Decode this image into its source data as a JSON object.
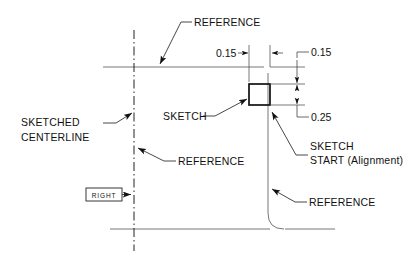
{
  "drawing": {
    "title": "Sketch alignment reference diagram",
    "background_color": "#ffffff",
    "line_color": "#111111",
    "reference_line_color": "#666666",
    "width": 412,
    "height": 259
  },
  "dimensions": [
    {
      "id": "horizontal-offset",
      "value": "0.15",
      "orientation": "horizontal",
      "position": "top-left-of-sketch"
    },
    {
      "id": "vertical-top-offset",
      "value": "0.15",
      "orientation": "vertical",
      "position": "right-upper"
    },
    {
      "id": "vertical-sketch-height",
      "value": "0.25",
      "orientation": "vertical",
      "position": "right-lower"
    }
  ],
  "annotations": [
    {
      "id": "reference-top",
      "label": "REFERENCE",
      "target": "top-horizontal-reference-line"
    },
    {
      "id": "sketched-centerline",
      "label_line_1": "SKETCHED",
      "label_line_2": "CENTERLINE",
      "target": "vertical-dash-dot-centerline"
    },
    {
      "id": "sketch",
      "label": "SKETCH",
      "target": "sketch-rectangle"
    },
    {
      "id": "reference-middle",
      "label": "REFERENCE",
      "target": "vertical-dash-dot-centerline"
    },
    {
      "id": "sketch-start",
      "label_line_1": "SKETCH",
      "label_line_2": "START (Alignment)",
      "target": "sketch-start-point"
    },
    {
      "id": "reference-bottom",
      "label": "REFERENCE",
      "target": "vertical-reference-line"
    }
  ],
  "view_tag": {
    "id": "right-view-tag",
    "label": "RIGHT"
  }
}
